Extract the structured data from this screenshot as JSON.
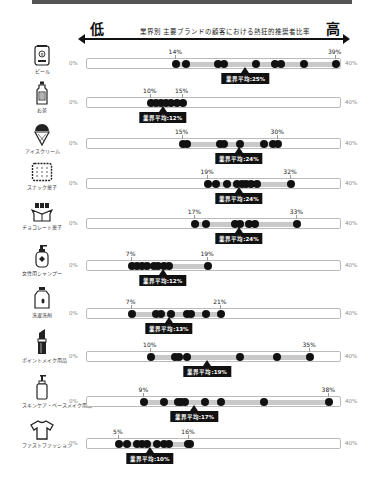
{
  "header": {
    "low_label": "低",
    "high_label": "高",
    "title": "業界別 主要ブランドの顧客における熱狂的推奨者比率"
  },
  "scale": {
    "min_label": "0%",
    "max_label": "40%"
  },
  "categories": [
    {
      "label": "ビール",
      "icon": "beer-can-icon",
      "min": 14,
      "max": 39,
      "min_label": "14%",
      "max_label": "39%",
      "avg": 25,
      "avg_label": "業界平均:25%",
      "dots": [
        14,
        15.5,
        20.5,
        21.5,
        26.5,
        29.5,
        30.5,
        34,
        39
      ]
    },
    {
      "label": "お茶",
      "icon": "tea-bottle-icon",
      "min": 10,
      "max": 15,
      "min_label": "10%",
      "max_label": "15%",
      "avg": 12,
      "avg_label": "業界平均:12%",
      "dots": [
        10,
        10.8,
        11.6,
        12.4,
        13.2,
        14.1,
        15
      ]
    },
    {
      "label": "アイスクリーム",
      "icon": "ice-cream-icon",
      "min": 15,
      "max": 30,
      "min_label": "15%",
      "max_label": "30%",
      "avg": 24,
      "avg_label": "業界平均:24%",
      "dots": [
        15,
        15.7,
        20.8,
        21.5,
        24,
        27.7,
        29.2,
        30
      ]
    },
    {
      "label": "スナック菓子",
      "icon": "cracker-icon",
      "min": 19,
      "max": 32,
      "min_label": "19%",
      "max_label": "32%",
      "avg": 24,
      "avg_label": "業界平均:24%",
      "dots": [
        19,
        20.3,
        22,
        23.6,
        24.3,
        25,
        25.8,
        26.6,
        32
      ]
    },
    {
      "label": "チョコレート菓子",
      "icon": "chocolate-icon",
      "min": 17,
      "max": 33,
      "min_label": "17%",
      "max_label": "33%",
      "avg": 24,
      "avg_label": "業界平均:24%",
      "dots": [
        17,
        18.7,
        23.2,
        24,
        25.4,
        26.3,
        33
      ]
    },
    {
      "label": "女性用シャンプー",
      "icon": "shampoo-icon",
      "min": 7,
      "max": 19,
      "min_label": "7%",
      "max_label": "19%",
      "avg": 12,
      "avg_label": "業界平均:12%",
      "dots": [
        7,
        7.8,
        8.6,
        9.4,
        10.5,
        11.2,
        12,
        12.8,
        19
      ]
    },
    {
      "label": "洗濯洗剤",
      "icon": "detergent-icon",
      "min": 7,
      "max": 21,
      "min_label": "7%",
      "max_label": "21%",
      "avg": 13,
      "avg_label": "業界平均:13%",
      "dots": [
        7,
        10.8,
        11.6,
        13.2,
        15.7,
        16.3,
        18.7,
        21
      ]
    },
    {
      "label": "ポイントメイク用品",
      "icon": "lipstick-icon",
      "min": 10,
      "max": 35,
      "min_label": "10%",
      "max_label": "35%",
      "avg": 19,
      "avg_label": "業界平均:19%",
      "dots": [
        10,
        13.8,
        14.5,
        15.7,
        24,
        29.8,
        35
      ]
    },
    {
      "label": "スキンケア・ベースメイク用品",
      "icon": "pump-bottle-icon",
      "min": 9,
      "max": 38,
      "min_label": "9%",
      "max_label": "38%",
      "avg": 17,
      "avg_label": "業界平均:17%",
      "dots": [
        9,
        12,
        14.2,
        14.8,
        15.4,
        18.5,
        21,
        27.8,
        38
      ]
    },
    {
      "label": "ファストファッション",
      "icon": "tshirt-icon",
      "min": 5,
      "max": 16,
      "min_label": "5%",
      "max_label": "16%",
      "avg": 10,
      "avg_label": "業界平均:10%",
      "dots": [
        5,
        6.3,
        7.8,
        8.6,
        9.4,
        11,
        12,
        12.8,
        15.8,
        16.2
      ]
    }
  ],
  "chart_data": {
    "type": "scatter",
    "title": "業界別 主要ブランドの顧客における熱狂的推奨者比率",
    "xlabel": "低 ← → 高",
    "xlim": [
      0,
      40
    ],
    "x_tick_labels": [
      "0%",
      "40%"
    ],
    "categories": [
      "ビール",
      "お茶",
      "アイスクリーム",
      "スナック菓子",
      "チョコレート菓子",
      "女性用シャンプー",
      "洗濯洗剤",
      "ポイントメイク用品",
      "スキンケア・ベースメイク用品",
      "ファストファッション"
    ],
    "series": [
      {
        "name": "min",
        "values": [
          14,
          10,
          15,
          19,
          17,
          7,
          7,
          10,
          9,
          5
        ]
      },
      {
        "name": "max",
        "values": [
          39,
          15,
          30,
          32,
          33,
          19,
          21,
          35,
          38,
          16
        ]
      },
      {
        "name": "業界平均",
        "values": [
          25,
          12,
          24,
          24,
          24,
          12,
          13,
          19,
          17,
          10
        ]
      }
    ],
    "grid": false,
    "legend": "none"
  }
}
